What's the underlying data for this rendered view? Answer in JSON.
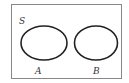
{
  "diagram": {
    "type": "venn",
    "universe": {
      "label": "S"
    },
    "sets": [
      {
        "label": "A"
      },
      {
        "label": "B"
      }
    ],
    "relationship": "disjoint"
  }
}
